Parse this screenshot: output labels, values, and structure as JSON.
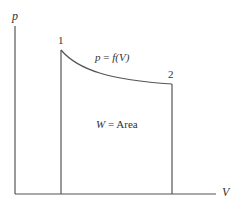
{
  "diagram": {
    "type": "p-V process diagram",
    "axes": {
      "y_label": "p",
      "x_label": "V"
    },
    "points": [
      {
        "id": "1",
        "label": "1"
      },
      {
        "id": "2",
        "label": "2"
      }
    ],
    "curve": {
      "label_lhs": "p",
      "label_eq": " = ",
      "label_rhs": "f(V)"
    },
    "area": {
      "label_lhs": "W",
      "label_eq": " = ",
      "label_rhs": "Area"
    },
    "colors": {
      "line": "#555555",
      "text": "#333333",
      "background": "#ffffff"
    }
  }
}
